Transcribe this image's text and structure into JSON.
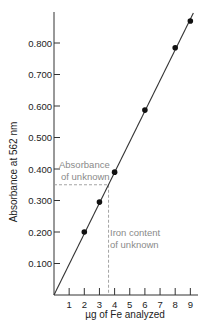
{
  "chart_data": {
    "type": "scatter",
    "title": "",
    "xlabel": "µg of Fe analyzed",
    "ylabel": "Absorbance at 562 nm",
    "xlim": [
      0,
      9.5
    ],
    "ylim": [
      0,
      0.9
    ],
    "x_ticks": [
      1,
      2,
      3,
      4,
      5,
      6,
      7,
      8,
      9
    ],
    "x_tick_labels": [
      "1",
      "2",
      "3",
      "4",
      "5",
      "6",
      "7",
      "8",
      "9"
    ],
    "y_ticks": [
      0.1,
      0.2,
      0.3,
      0.4,
      0.5,
      0.6,
      0.7,
      0.8
    ],
    "y_tick_labels": [
      "0.100",
      "0.200",
      "0.300",
      "0.400",
      "0.500",
      "0.600",
      "0.700",
      "0.800"
    ],
    "grid": false,
    "legend": null,
    "series": [
      {
        "name": "Standards",
        "x": [
          2,
          3,
          4,
          6,
          8,
          9
        ],
        "y": [
          0.2,
          0.295,
          0.39,
          0.587,
          0.785,
          0.87
        ],
        "marker": "circle"
      }
    ],
    "fit_line": {
      "x": [
        0,
        9.2
      ],
      "y": [
        0,
        0.895
      ]
    },
    "unknown": {
      "absorbance": 0.35,
      "iron_content": 3.6
    },
    "annotations": [
      {
        "text_lines": [
          "Absorbance",
          "of unknown"
        ],
        "target": "horizontal dashed line at absorbance of unknown"
      },
      {
        "text_lines": [
          "Iron content",
          "of unknown"
        ],
        "target": "vertical dashed line at iron content of unknown"
      }
    ]
  },
  "annotations": {
    "absorbance_line1": "Absorbance",
    "absorbance_line2": "of unknown",
    "iron_line1": "Iron content",
    "iron_line2": "of unknown"
  },
  "colors": {
    "axis": "#333333",
    "line": "#333333",
    "points": "#111111",
    "dashed": "#9a9a9a",
    "annotation_text": "#8a8a8a"
  }
}
